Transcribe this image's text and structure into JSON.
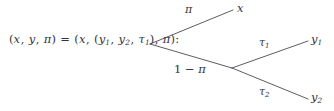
{
  "figure": {
    "type": "probability-tree-diagram",
    "background_color": "#ffffff",
    "line_color": "#4a4a52",
    "text_color": "#33333a"
  },
  "lhs": {
    "full_text": "(x, y, π) = (x, (y₁, y₂, τ₁), π):",
    "open1": "(",
    "var_x": "x",
    "comma1": ", ",
    "var_y": "y",
    "comma2": ", ",
    "var_pi": "π",
    "close1": ")",
    "equals": " = ",
    "open2": "(",
    "var_x2": "x",
    "comma3": ", ",
    "open3": "(",
    "var_y1": "y",
    "sub_y1": "1",
    "comma4": ", ",
    "var_y2": "y",
    "sub_y2": "2",
    "comma5": ", ",
    "var_tau1": "τ",
    "sub_tau1": "1",
    "close3": ")",
    "comma6": ", ",
    "var_pi2": "π",
    "close2": ")",
    "colon": ":"
  },
  "branches": {
    "top": {
      "probability_label": "π",
      "outcome_label": "x",
      "outcome_sub": ""
    },
    "bottom": {
      "probability_label": "1 − π",
      "probability_one": "1",
      "probability_minus": " − ",
      "probability_pi": "π"
    },
    "upper_right": {
      "probability_label": "τ",
      "probability_sub": "1",
      "outcome_label": "y",
      "outcome_sub": "1"
    },
    "lower_right": {
      "probability_label": "τ",
      "probability_sub": "2",
      "outcome_label": "y",
      "outcome_sub": "2"
    }
  },
  "geometry": {
    "root_node": {
      "x": 150,
      "y": 44
    },
    "second_node": {
      "x": 232,
      "y": 68
    },
    "top_end": {
      "x": 233,
      "y": 10
    },
    "y1_end": {
      "x": 308,
      "y": 41
    },
    "y2_end": {
      "x": 308,
      "y": 99
    }
  }
}
